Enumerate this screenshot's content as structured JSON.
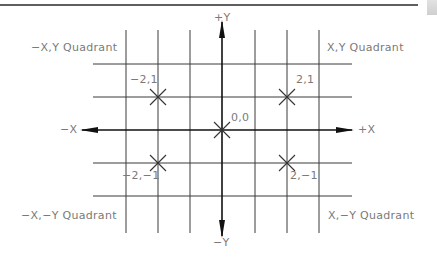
{
  "diagram": {
    "axes": {
      "pos_y": "+Y",
      "neg_y": "−Y",
      "pos_x": "+X",
      "neg_x": "−X"
    },
    "quadrants": {
      "top_left": "−X,Y Quadrant",
      "top_right": "X,Y Quadrant",
      "bottom_left": "−X,−Y Quadrant",
      "bottom_right": "X,−Y Quadrant"
    },
    "points": [
      {
        "label": "−2,1",
        "x": -2,
        "y": 1
      },
      {
        "label": "2,1",
        "x": 2,
        "y": 1
      },
      {
        "label": "0,0",
        "x": 0,
        "y": 0
      },
      {
        "label": "−2,−1",
        "x": -2,
        "y": -1
      },
      {
        "label": "2,−1",
        "x": 2,
        "y": -1
      }
    ],
    "colors": {
      "line": "#1a1a1a",
      "grid": "#3a3a3a",
      "text": "#7a7a7a"
    }
  }
}
